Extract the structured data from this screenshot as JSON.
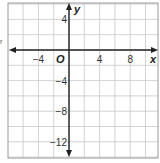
{
  "chart_data": {
    "type": "scatter",
    "title": "",
    "xlabel": "x",
    "ylabel": "y",
    "origin_label": "O",
    "xlim": [
      -8,
      11.5
    ],
    "ylim": [
      -14,
      6.5
    ],
    "grid": true,
    "grid_step": 2,
    "x_ticks": [
      -4,
      4,
      8
    ],
    "y_ticks": [
      4,
      -4,
      -8,
      -12
    ],
    "x_tick_labels": [
      "−4",
      "4",
      "8"
    ],
    "y_tick_labels": [
      "4",
      "−4",
      "−8",
      "−12"
    ],
    "series": [],
    "colors": {
      "grid": "#c8c8c8",
      "axis": "#222222",
      "frame": "#9a9a9a"
    }
  },
  "stray_mark": "r"
}
